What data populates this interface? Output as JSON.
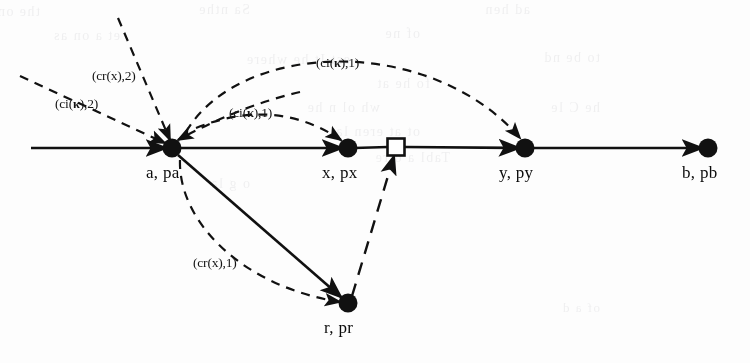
{
  "figure": {
    "background_color": "#fdfdfd",
    "ink_color": "#111111",
    "width": 750,
    "height": 363
  },
  "nodes": [
    {
      "id": "a",
      "label": "a, pa",
      "shape": "filled-circle",
      "x": 172,
      "y": 148,
      "label_x": 146,
      "label_y": 163
    },
    {
      "id": "x",
      "label": "x, px",
      "shape": "filled-circle",
      "x": 348,
      "y": 148,
      "label_x": 322,
      "label_y": 163
    },
    {
      "id": "sq",
      "label": "",
      "shape": "open-square",
      "x": 396,
      "y": 147,
      "label_x": 0,
      "label_y": 0
    },
    {
      "id": "y",
      "label": "y, py",
      "shape": "filled-circle",
      "x": 525,
      "y": 148,
      "label_x": 499,
      "label_y": 163
    },
    {
      "id": "b",
      "label": "b, pb",
      "shape": "filled-circle",
      "x": 708,
      "y": 148,
      "label_x": 682,
      "label_y": 163
    },
    {
      "id": "r",
      "label": "r, pr",
      "shape": "filled-circle",
      "x": 348,
      "y": 303,
      "label_x": 324,
      "label_y": 318
    }
  ],
  "edge_labels": [
    {
      "id": "cr-x-2",
      "text_pre": "(cr(x),2)",
      "kappa": false,
      "x": 92,
      "y": 68,
      "target": "a"
    },
    {
      "id": "ci-k-2",
      "text_pre": "(ci(",
      "kappa": true,
      "text_post": "),2)",
      "x": 55,
      "y": 96,
      "target": "a"
    },
    {
      "id": "ci-k-1-arc",
      "text_pre": "(ci(",
      "kappa": true,
      "text_post": "),1)",
      "x": 316,
      "y": 55,
      "target": "y"
    },
    {
      "id": "ci-k-1-short",
      "text_pre": "(ci(",
      "kappa": true,
      "text_post": "),1)",
      "x": 229,
      "y": 105,
      "target": "x"
    },
    {
      "id": "cr-x-1",
      "text_pre": "(cr(x),1)",
      "kappa": false,
      "x": 193,
      "y": 255,
      "target": "r"
    }
  ],
  "ghost_text": [
    {
      "text": "the one of them",
      "x": 40,
      "y": 4,
      "size": 14
    },
    {
      "text": "Sa  nthe",
      "x": 250,
      "y": 2,
      "size": 14
    },
    {
      "text": "ad  hen",
      "x": 530,
      "y": 2,
      "size": 14
    },
    {
      "text": "et  a  on  as",
      "x": 120,
      "y": 28,
      "size": 14
    },
    {
      "text": "of  ne",
      "x": 420,
      "y": 26,
      "size": 14
    },
    {
      "text": "est  It  he  where",
      "x": 350,
      "y": 52,
      "size": 14
    },
    {
      "text": "to be  nd",
      "x": 600,
      "y": 50,
      "size": 14
    },
    {
      "text": "fo  he  at",
      "x": 430,
      "y": 76,
      "size": 14
    },
    {
      "text": "wh  ol  n  he",
      "x": 380,
      "y": 100,
      "size": 14
    },
    {
      "text": "he  C  le",
      "x": 600,
      "y": 100,
      "size": 14
    },
    {
      "text": "ot  at  eren  la",
      "x": 420,
      "y": 124,
      "size": 14
    },
    {
      "text": "Tabl  a  o  re",
      "x": 450,
      "y": 150,
      "size": 14
    },
    {
      "text": "o  g  la",
      "x": 250,
      "y": 176,
      "size": 14
    },
    {
      "text": "of  a  d",
      "x": 600,
      "y": 300,
      "size": 13
    }
  ]
}
